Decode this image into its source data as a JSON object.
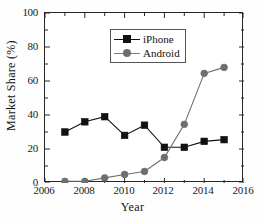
{
  "chart_data": {
    "type": "line",
    "title": "",
    "xlabel": "Year",
    "ylabel": "Market Share (%)",
    "xlim": [
      2006,
      2016
    ],
    "ylim": [
      0,
      100
    ],
    "xticks": [
      2006,
      2008,
      2010,
      2012,
      2014,
      2016
    ],
    "yticks": [
      0,
      20,
      40,
      60,
      80,
      100
    ],
    "grid": false,
    "legend_position": "upper center",
    "x": [
      2007,
      2008,
      2009,
      2010,
      2011,
      2012,
      2013,
      2014,
      2015
    ],
    "series": [
      {
        "name": "iPhone",
        "marker": "square",
        "color": "#111111",
        "values": [
          30,
          36,
          39,
          28,
          34,
          21,
          21,
          24.5,
          25.5
        ]
      },
      {
        "name": "Android",
        "marker": "circle",
        "color": "#6e6e6e",
        "values": [
          1,
          1,
          3,
          5,
          6.8,
          15,
          34.5,
          64.5,
          68
        ]
      }
    ]
  },
  "axis": {
    "x_tick_labels": [
      "2006",
      "2008",
      "2010",
      "2012",
      "2014",
      "2016"
    ],
    "y_tick_labels": [
      "0",
      "20",
      "40",
      "60",
      "80",
      "100"
    ],
    "x_title": "Year",
    "y_title": "Market Share (%)"
  },
  "legend": {
    "items": [
      {
        "label": "iPhone",
        "marker": "square-marker",
        "color": "#111111"
      },
      {
        "label": "Android",
        "marker": "circle-marker",
        "color": "#6e6e6e"
      }
    ]
  }
}
